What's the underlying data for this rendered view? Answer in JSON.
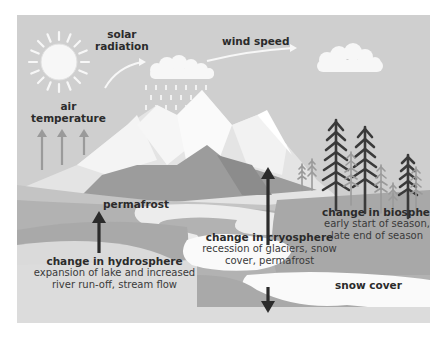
{
  "diagram": {
    "colors": {
      "sky": "#cfcfcf",
      "mountain_light": "#f2f2f2",
      "mountain_mid": "#dcdcdc",
      "mountain_dark": "#9c9c9c",
      "ground_light": "#c4c4c4",
      "ground_mid": "#a9a9a9",
      "water": "#ececec",
      "snow": "#fafafa",
      "arrow_dark": "#2b2b2b",
      "arrow_light": "#999999",
      "tree_dark": "#3a3a3a",
      "tree_light": "#9a9a9a"
    },
    "labels": {
      "solar_radiation": [
        "solar",
        "radiation"
      ],
      "wind_speed": "wind speed",
      "air_temperature": [
        "air",
        "temperature"
      ],
      "permafrost": "permafrost",
      "snow_cover": "snow cover",
      "hydrosphere": {
        "title": "change in hydrosphere",
        "lines": [
          "expansion of lake and increased",
          "river run-off, stream flow"
        ]
      },
      "cryosphere": {
        "title": "change in cryosphere",
        "lines": [
          "recession of glaciers, snow",
          "cover, permafrost"
        ]
      },
      "biosphere": {
        "title": "change in biosphere",
        "lines": [
          "early start of season,",
          "late end of season"
        ]
      }
    },
    "icons": [
      "sun-icon",
      "rain-cloud-icon",
      "cloud-icon",
      "mountain-icon",
      "tree-icon",
      "arrow-up-icon",
      "arrow-down-icon",
      "curved-arrow-icon"
    ]
  }
}
